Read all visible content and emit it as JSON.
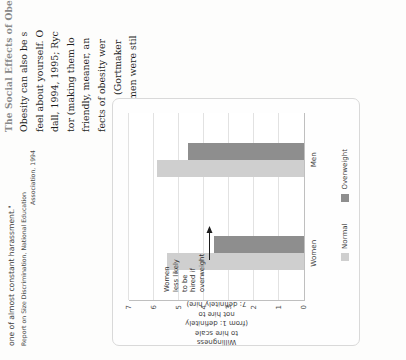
{
  "page": {
    "section_heading": "The Social Effects of Obesity",
    "pullquote": {
      "lines": [
        "one of almost constant harassment.\""
      ],
      "credit_line_1": "Report on Size Discrimination, National Education",
      "credit_line_2": "Association, 1994"
    },
    "body_columns": [
      {
        "name": "column-left",
        "lines": [
          "Obesity can also be s",
          "feel about yourself. O",
          "dall, 1994, 1995; Ryc",
          "tor (making them lo",
          "friendly, meaner, an",
          "fects of obesity wer",
          "women (Gortmaker",
          "the women were stil"
        ]
      },
      {
        "name": "column-middle",
        "lines": [
          "that",
          "norm",
          "som",
          "adve",
          "I",
          "(19",
          "job",
          "nor"
        ]
      },
      {
        "name": "column-right",
        "lines": [
          "norm",
          "look",
          "over",
          "gest",
          "ciall",
          "reve",
          "grea",
          "of th",
          "tion"
        ]
      }
    ]
  },
  "chart_data": {
    "type": "bar",
    "orientation": "vertical",
    "title": "",
    "xlabel": "",
    "ylabel": "Willingness to hire scale (from 1: definitely not hire to 7: definitely hire)",
    "ylabel_lines": [
      "Willingness",
      "to hire scale",
      "(from 1: definitely",
      "not hire to",
      "7: definitely hire)"
    ],
    "ylim": [
      0,
      7
    ],
    "yticks": [
      0,
      1,
      2,
      3,
      4,
      5,
      6,
      7
    ],
    "ytick_labels": [
      "0",
      "1",
      "2",
      "3",
      "4",
      "5",
      "6",
      "7"
    ],
    "grid": true,
    "grid_axis": "y",
    "categories": [
      "Women",
      "Men"
    ],
    "legend_position": "bottom",
    "series": [
      {
        "name": "Normal",
        "color": "#cfcfcf",
        "values": [
          5.5,
          5.9
        ]
      },
      {
        "name": "Overweight",
        "color": "#8e8e8e",
        "values": [
          3.6,
          4.65
        ]
      }
    ],
    "annotations": [
      {
        "text": "Women less likely to be hired if overweight",
        "lines": [
          "Women",
          "less likely",
          "to be",
          "hired if",
          "overweight"
        ],
        "points_to": {
          "category": "Women",
          "series": "Overweight"
        }
      }
    ]
  },
  "colors": {
    "normal": "#cfcfcf",
    "overweight": "#8e8e8e",
    "grid": "#e2e2e2",
    "axis": "#bfbfbf",
    "frame": "#d9d9d9"
  }
}
